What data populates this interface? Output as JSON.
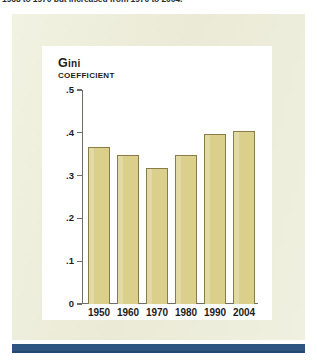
{
  "caption": {
    "text": "1968 to 1970 but increased from 1970 to 2004."
  },
  "figure": {
    "axis_title_main": "Gini",
    "axis_title_sub": "COEFFICIENT"
  },
  "colors": {
    "page_background": "#ffffff",
    "panel_background": "#eeeedb",
    "plot_background": "#ffffff",
    "bar_fill": "#dad08b",
    "bar_outline": "#8a7c46",
    "axis_line": "#6e6e68",
    "text": "#1c1c1c",
    "rule": "#2d557f"
  },
  "chart_data": {
    "type": "bar",
    "title": "Gini COEFFICIENT",
    "xlabel": "",
    "ylabel": "Gini coefficient",
    "categories": [
      "1950",
      "1960",
      "1970",
      "1980",
      "1990",
      "2004"
    ],
    "values": [
      0.367,
      0.349,
      0.318,
      0.348,
      0.397,
      0.405
    ],
    "ylim": [
      0,
      0.5
    ],
    "yticks": [
      0,
      0.1,
      0.2,
      0.3,
      0.4,
      0.5
    ],
    "ytick_labels": [
      "0",
      ".1",
      ".2",
      ".3",
      ".4",
      ".5"
    ],
    "grid": false,
    "legend": null
  }
}
